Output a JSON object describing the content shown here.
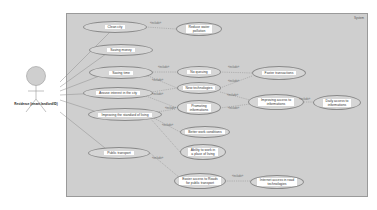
{
  "diagram": {
    "type": "uml-use-case",
    "system": {
      "label": "System"
    },
    "actor": {
      "name": "Residence (tenant landlord/ID)"
    },
    "use_cases": [
      {
        "id": "clean_city",
        "label": "Clean city"
      },
      {
        "id": "reduce_pollution",
        "label": "Reduce water\npollution"
      },
      {
        "id": "saving_money",
        "label": "Saving money"
      },
      {
        "id": "saving_time",
        "label": "Saving time"
      },
      {
        "id": "no_queuing",
        "label": "No queuing"
      },
      {
        "id": "faster_transactions",
        "label": "Faster transactions"
      },
      {
        "id": "new_technologies",
        "label": "New technologies"
      },
      {
        "id": "arouse_interest",
        "label": "Arouse interest in the city"
      },
      {
        "id": "promoting_information",
        "label": "Promoting\ninformations"
      },
      {
        "id": "improving_access",
        "label": "Improving access to\ninformations"
      },
      {
        "id": "daily_access",
        "label": "Daily access to\ninformations"
      },
      {
        "id": "improving_standard",
        "label": "Improving the standard of living"
      },
      {
        "id": "better_work",
        "label": "Better work conditions"
      },
      {
        "id": "ability_to_work",
        "label": "Ability to work in\na place of living"
      },
      {
        "id": "public_transport",
        "label": "Public transport"
      },
      {
        "id": "easier_access_public",
        "label": "Easier access to Roads\nfor public transport"
      },
      {
        "id": "internet_access",
        "label": "Internet access in road\ntechnologies"
      }
    ],
    "stereotype": "«include»",
    "relations": [
      {
        "from": "clean_city",
        "to": "reduce_pollution",
        "label": "«include»"
      },
      {
        "from": "saving_time",
        "to": "no_queuing",
        "label": "«include»"
      },
      {
        "from": "no_queuing",
        "to": "faster_transactions",
        "label": "«include»"
      },
      {
        "from": "saving_time",
        "to": "new_technologies",
        "label": "«include»"
      },
      {
        "from": "new_technologies",
        "to": "faster_transactions",
        "label": "«include»"
      },
      {
        "from": "arouse_interest",
        "to": "new_technologies",
        "label": "«include»"
      },
      {
        "from": "arouse_interest",
        "to": "promoting_information",
        "label": "«include»"
      },
      {
        "from": "new_technologies",
        "to": "improving_access",
        "label": "«include»"
      },
      {
        "from": "promoting_information",
        "to": "improving_access",
        "label": "«include»"
      },
      {
        "from": "improving_access",
        "to": "daily_access",
        "label": "«include»"
      },
      {
        "from": "improving_standard",
        "to": "promoting_information",
        "label": "«include»"
      },
      {
        "from": "improving_standard",
        "to": "better_work",
        "label": "«include»"
      },
      {
        "from": "improving_standard",
        "to": "ability_to_work",
        "label": "«include»"
      },
      {
        "from": "public_transport",
        "to": "easier_access_public",
        "label": "«include»"
      },
      {
        "from": "easier_access_public",
        "to": "internet_access",
        "label": "«include»"
      }
    ]
  }
}
